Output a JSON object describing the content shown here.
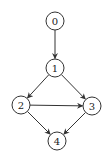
{
  "graph": {
    "nodes": [
      {
        "id": "0",
        "label": "0",
        "x": 55,
        "y": 21
      },
      {
        "id": "1",
        "label": "1",
        "x": 55,
        "y": 68
      },
      {
        "id": "2",
        "label": "2",
        "x": 21,
        "y": 105
      },
      {
        "id": "3",
        "label": "3",
        "x": 92,
        "y": 106
      },
      {
        "id": "4",
        "label": "4",
        "x": 57,
        "y": 141
      }
    ],
    "edges": [
      {
        "from": "0",
        "to": "1"
      },
      {
        "from": "1",
        "to": "2"
      },
      {
        "from": "1",
        "to": "3"
      },
      {
        "from": "2",
        "to": "3"
      },
      {
        "from": "2",
        "to": "4"
      },
      {
        "from": "3",
        "to": "4"
      }
    ],
    "node_radius": 9,
    "stroke_color": "#333333"
  }
}
